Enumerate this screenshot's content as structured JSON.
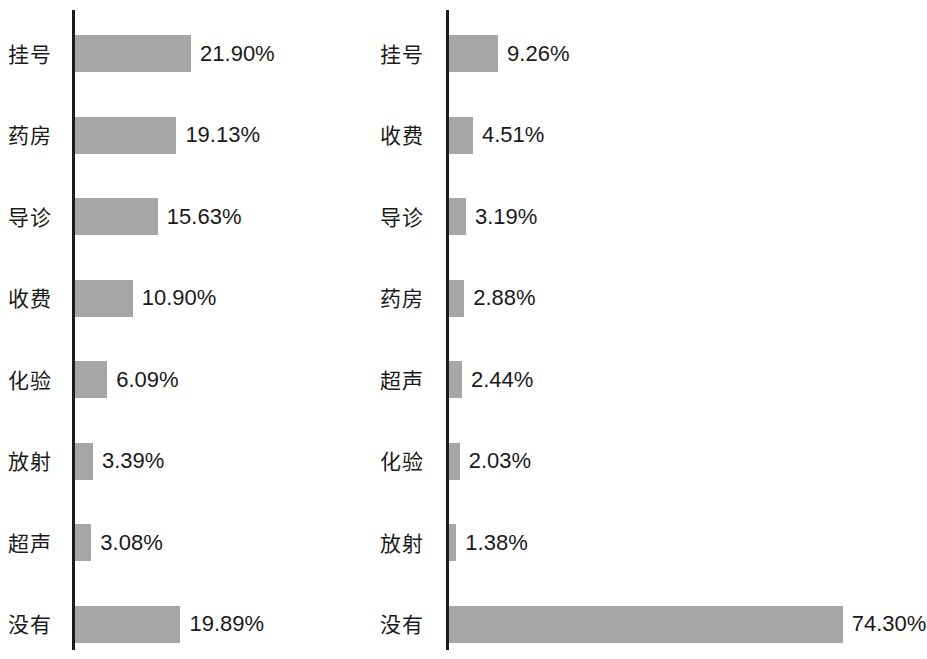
{
  "chart_data": [
    {
      "type": "bar",
      "orientation": "horizontal",
      "title": "",
      "xlabel": "",
      "ylabel": "",
      "grid": false,
      "legend": "none",
      "axis_visible": "y-axis-only",
      "value_format": "percent",
      "xlim": [
        0,
        80
      ],
      "categories": [
        "挂号",
        "药房",
        "导诊",
        "收费",
        "化验",
        "放射",
        "超声",
        "没有"
      ],
      "values": [
        21.9,
        19.13,
        15.63,
        10.9,
        6.09,
        3.39,
        3.08,
        19.89
      ],
      "value_labels": [
        "21.90%",
        "19.13%",
        "15.63%",
        "10.90%",
        "6.09%",
        "3.39%",
        "3.08%",
        "19.89%"
      ]
    },
    {
      "type": "bar",
      "orientation": "horizontal",
      "title": "",
      "xlabel": "",
      "ylabel": "",
      "grid": false,
      "legend": "none",
      "axis_visible": "y-axis-only",
      "value_format": "percent",
      "xlim": [
        0,
        80
      ],
      "categories": [
        "挂号",
        "收费",
        "导诊",
        "药房",
        "超声",
        "化验",
        "放射",
        "没有"
      ],
      "values": [
        9.26,
        4.51,
        3.19,
        2.88,
        2.44,
        2.03,
        1.38,
        74.3
      ],
      "value_labels": [
        "9.26%",
        "4.51%",
        "3.19%",
        "2.88%",
        "2.44%",
        "2.03%",
        "1.38%",
        "74.30%"
      ]
    }
  ],
  "style": {
    "bar_color": "#a6a6a6",
    "axis_color": "#1c1c1c",
    "text_color": "#1a1a1a",
    "background": "#ffffff"
  }
}
